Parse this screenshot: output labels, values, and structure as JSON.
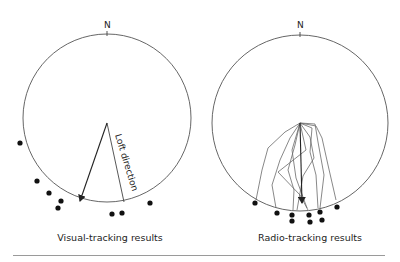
{
  "panels": [
    {
      "id": "visual",
      "north_label": "N",
      "caption": "Visual-tracking results",
      "arrow_annotation": "Loft direction",
      "circle": {
        "cx": 107,
        "cy": 118,
        "r": 84
      },
      "arrow": {
        "x1": 107,
        "y1": 123,
        "x2": 80,
        "y2": 201
      },
      "loft_line": {
        "x1": 107,
        "y1": 123,
        "x2": 124,
        "y2": 202
      },
      "dots": [
        [
          20,
          143
        ],
        [
          37,
          181
        ],
        [
          49,
          193
        ],
        [
          61,
          201
        ],
        [
          58,
          208
        ],
        [
          112,
          214
        ],
        [
          122,
          213
        ],
        [
          150,
          203
        ]
      ]
    },
    {
      "id": "radio",
      "north_label": "N",
      "caption": "Radio-tracking results",
      "circle": {
        "cx": 300,
        "cy": 123,
        "r": 88
      },
      "arrow": {
        "x1": 300,
        "y1": 123,
        "x2": 302,
        "y2": 203
      },
      "tracks": [
        [
          [
            300,
            123
          ],
          [
            285,
            132
          ],
          [
            268,
            148
          ],
          [
            262,
            170
          ],
          [
            256,
            200
          ]
        ],
        [
          [
            300,
            123
          ],
          [
            290,
            138
          ],
          [
            280,
            160
          ],
          [
            272,
            185
          ],
          [
            276,
            208
          ]
        ],
        [
          [
            300,
            123
          ],
          [
            295,
            145
          ],
          [
            288,
            170
          ],
          [
            294,
            190
          ],
          [
            293,
            210
          ]
        ],
        [
          [
            300,
            123
          ],
          [
            310,
            137
          ],
          [
            314,
            158
          ],
          [
            303,
            176
          ],
          [
            297,
            210
          ]
        ],
        [
          [
            300,
            123
          ],
          [
            306,
            150
          ],
          [
            278,
            172
          ],
          [
            300,
            195
          ],
          [
            308,
            210
          ]
        ],
        [
          [
            300,
            123
          ],
          [
            312,
            128
          ],
          [
            310,
            152
          ],
          [
            316,
            175
          ],
          [
            318,
            208
          ]
        ],
        [
          [
            300,
            123
          ],
          [
            315,
            124
          ],
          [
            318,
            142
          ],
          [
            324,
            175
          ],
          [
            320,
            208
          ]
        ],
        [
          [
            300,
            123
          ],
          [
            292,
            150
          ],
          [
            296,
            178
          ],
          [
            307,
            208
          ]
        ],
        [
          [
            300,
            123
          ],
          [
            316,
            126
          ],
          [
            322,
            138
          ],
          [
            328,
            165
          ],
          [
            336,
            200
          ]
        ]
      ],
      "dots": [
        [
          255,
          203
        ],
        [
          277,
          213
        ],
        [
          292,
          215
        ],
        [
          292,
          221
        ],
        [
          309,
          215
        ],
        [
          310,
          222
        ],
        [
          320,
          212
        ],
        [
          322,
          220
        ],
        [
          337,
          207
        ]
      ]
    }
  ],
  "colors": {
    "circle": "#555555",
    "track": "#6a6a6a",
    "arrow": "#222222",
    "dot": "#111111",
    "rule": "#9a9a9a"
  }
}
